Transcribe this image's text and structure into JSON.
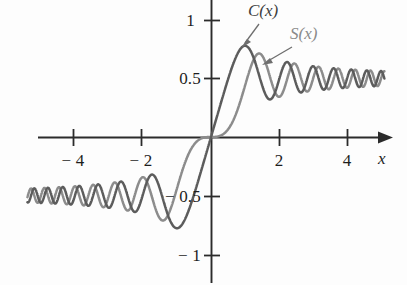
{
  "figure": {
    "background": "#fdfdfd",
    "width": 407,
    "height": 285
  },
  "axes": {
    "x_axis_label": "x",
    "y_axis_label": "y",
    "origin_px": [
      211,
      137
    ],
    "x_scale_px_per_unit": 34,
    "y_scale_px_per_unit": 117,
    "x_ticks": [
      {
        "value": -4,
        "label": "− 4",
        "px_x": 73
      },
      {
        "value": -2,
        "label": "− 2",
        "px_x": 141
      },
      {
        "value": 2,
        "label": "2",
        "px_x": 279
      },
      {
        "value": 4,
        "label": "4",
        "px_x": 347
      }
    ],
    "y_ticks": [
      {
        "value": 1,
        "label": "1",
        "px_y": 20
      },
      {
        "value": 0.5,
        "label": "0.5",
        "px_y": 78
      },
      {
        "value": -0.5,
        "label": "− 0.5",
        "px_y": 196
      },
      {
        "value": -1,
        "label": "− 1",
        "px_y": 255
      }
    ]
  },
  "annotations": [
    {
      "id": "label-c",
      "text": "C(x)",
      "color": "#3d3d3d",
      "px": [
        248,
        3
      ],
      "leader_from": [
        258,
        24
      ],
      "leader_to": [
        242,
        46
      ]
    },
    {
      "id": "label-s",
      "text": "S(x)",
      "color": "#8a8a8a",
      "px": [
        290,
        26
      ],
      "leader_from": [
        292,
        47
      ],
      "leader_to": [
        262,
        64
      ]
    }
  ],
  "chart_data": {
    "type": "line",
    "xlabel": "x",
    "ylabel": "y",
    "xlim": [
      -5.4,
      5.1
    ],
    "ylim": [
      -1.12,
      1.12
    ],
    "grid": false,
    "legend": "inline-annotations",
    "x_ticks": [
      -4,
      -2,
      2,
      4
    ],
    "y_ticks": [
      -1,
      -0.5,
      0.5,
      1
    ],
    "asymptotes": [
      0.5,
      -0.5
    ],
    "series": [
      {
        "name": "C(x)",
        "color": "#5c5c5c",
        "definition": "C(x) = integral from 0 to x of cos(pi t^2 / 2) dt",
        "x": [
          -5.2,
          -5.0,
          -4.8,
          -4.6,
          -4.4,
          -4.2,
          -4.0,
          -3.8,
          -3.6,
          -3.4,
          -3.2,
          -3.0,
          -2.8,
          -2.6,
          -2.4,
          -2.2,
          -2.0,
          -1.8,
          -1.6,
          -1.4,
          -1.2,
          -1.0,
          -0.8,
          -0.6,
          -0.4,
          -0.2,
          0.0,
          0.2,
          0.4,
          0.6,
          0.8,
          1.0,
          1.2,
          1.4,
          1.6,
          1.8,
          2.0,
          2.2,
          2.4,
          2.6,
          2.8,
          3.0,
          3.2,
          3.4,
          3.6,
          3.8,
          4.0,
          4.2,
          4.4,
          4.6,
          4.8,
          5.0,
          5.2
        ],
        "y": [
          -0.476,
          -0.5636,
          -0.4934,
          -0.42,
          -0.5186,
          -0.5417,
          -0.4984,
          -0.4481,
          -0.588,
          -0.4296,
          -0.4664,
          -0.6058,
          -0.4675,
          -0.3889,
          -0.5496,
          -0.6362,
          -0.4883,
          -0.3337,
          -0.389,
          -0.5431,
          -0.7154,
          -0.7799,
          -0.7228,
          -0.5811,
          -0.3975,
          -0.1999,
          0.0,
          0.1999,
          0.3975,
          0.5811,
          0.7228,
          0.7799,
          0.7154,
          0.5431,
          0.389,
          0.3337,
          0.4883,
          0.6362,
          0.5496,
          0.3889,
          0.4675,
          0.6058,
          0.4664,
          0.4296,
          0.588,
          0.4481,
          0.4984,
          0.5417,
          0.5186,
          0.42,
          0.4934,
          0.5636,
          0.476
        ]
      },
      {
        "name": "S(x)",
        "color": "#8c8c8c",
        "definition": "S(x) = integral from 0 to x of sin(pi t^2 / 2) dt",
        "x": [
          -5.2,
          -5.0,
          -4.8,
          -4.6,
          -4.4,
          -4.2,
          -4.0,
          -3.8,
          -3.6,
          -3.4,
          -3.2,
          -3.0,
          -2.8,
          -2.6,
          -2.4,
          -2.2,
          -2.0,
          -1.8,
          -1.6,
          -1.4,
          -1.2,
          -1.0,
          -0.8,
          -0.6,
          -0.4,
          -0.2,
          0.0,
          0.2,
          0.4,
          0.6,
          0.8,
          1.0,
          1.2,
          1.4,
          1.6,
          1.8,
          2.0,
          2.2,
          2.4,
          2.6,
          2.8,
          3.0,
          3.2,
          3.4,
          3.6,
          3.8,
          4.0,
          4.2,
          4.4,
          4.6,
          4.8,
          5.0,
          5.2
        ],
        "y": [
          -0.4969,
          -0.4992,
          -0.5672,
          -0.4342,
          -0.4296,
          -0.5632,
          -0.4205,
          -0.565,
          -0.4923,
          -0.4296,
          -0.5933,
          -0.4963,
          -0.3983,
          -0.55,
          -0.6196,
          -0.6363,
          -0.3434,
          -0.4509,
          -0.6389,
          -0.7135,
          -0.6234,
          -0.4383,
          -0.2493,
          -0.1105,
          -0.0334,
          -0.0042,
          0.0,
          0.0042,
          0.0334,
          0.1105,
          0.2493,
          0.4383,
          0.6234,
          0.7135,
          0.6389,
          0.4509,
          0.3434,
          0.6363,
          0.6196,
          0.55,
          0.3983,
          0.4963,
          0.5933,
          0.4296,
          0.4923,
          0.565,
          0.4205,
          0.5632,
          0.4296,
          0.4342,
          0.5672,
          0.4992,
          0.4969
        ]
      }
    ]
  }
}
